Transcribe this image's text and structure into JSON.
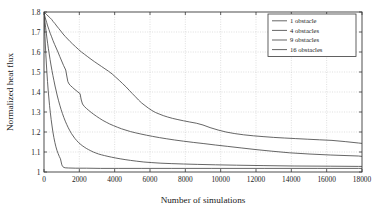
{
  "chart_data": {
    "type": "line",
    "title": "",
    "xlabel": "Number of simulations",
    "ylabel": "Normalized heat flux",
    "xlim": [
      0,
      18000
    ],
    "ylim": [
      1.0,
      1.8
    ],
    "grid": true,
    "legend_position": "top-right",
    "xticks": [
      0,
      2000,
      4000,
      6000,
      8000,
      10000,
      12000,
      14000,
      16000,
      18000
    ],
    "xtick_labels": [
      "0",
      "2000",
      "4000",
      "6000",
      "8000",
      "10000",
      "12000",
      "14000",
      "16000",
      "18000"
    ],
    "yticks": [
      1.0,
      1.1,
      1.2,
      1.3,
      1.4,
      1.5,
      1.6,
      1.7,
      1.8
    ],
    "ytick_labels": [
      "1",
      "1.1",
      "1.2",
      "1.3",
      "1.4",
      "1.5",
      "1.6",
      "1.7",
      "1.8"
    ],
    "line_color": "#4a4a4a",
    "grid_color": "#c9c9c9",
    "axis_color": "#3a3a3a",
    "series": [
      {
        "name": "1 obstacle",
        "x": [
          0,
          60,
          140,
          230,
          330,
          430,
          520,
          620,
          720,
          830,
          950,
          1080,
          1200,
          1340,
          1480,
          1620,
          1780,
          1950,
          2120,
          2300,
          2480,
          2660,
          2850,
          3050,
          3250,
          3450,
          3650,
          3860,
          4060,
          4260,
          4450,
          4650,
          4830,
          5000,
          5180,
          5350,
          5530,
          5720,
          5900,
          6100,
          6300,
          6520,
          6750,
          7000,
          7280,
          7580,
          7900,
          8250,
          8620,
          9000,
          9400,
          9850,
          10300,
          10800,
          11300,
          11850,
          12400,
          13000,
          13600,
          14250,
          14900,
          15600,
          16300,
          17050,
          17800
        ],
        "y": [
          1.8,
          1.795,
          1.788,
          1.78,
          1.772,
          1.763,
          1.752,
          1.742,
          1.73,
          1.718,
          1.705,
          1.69,
          1.678,
          1.665,
          1.652,
          1.64,
          1.627,
          1.613,
          1.6,
          1.588,
          1.576,
          1.564,
          1.552,
          1.54,
          1.528,
          1.516,
          1.504,
          1.49,
          1.474,
          1.458,
          1.442,
          1.425,
          1.408,
          1.392,
          1.376,
          1.36,
          1.345,
          1.332,
          1.32,
          1.308,
          1.298,
          1.29,
          1.282,
          1.275,
          1.268,
          1.262,
          1.256,
          1.25,
          1.244,
          1.235,
          1.222,
          1.21,
          1.2,
          1.192,
          1.186,
          1.181,
          1.177,
          1.173,
          1.17,
          1.167,
          1.164,
          1.161,
          1.158,
          1.152,
          1.145
        ],
        "final_value": 1.143
      },
      {
        "name": "4 obstacles",
        "x": [
          0,
          40,
          90,
          150,
          210,
          280,
          350,
          430,
          510,
          600,
          690,
          790,
          890,
          1000,
          1110,
          1230,
          1290,
          1350,
          1420,
          1500,
          1600,
          1700,
          1810,
          1920,
          2040,
          2110,
          2180,
          2280,
          2400,
          2530,
          2670,
          2820,
          2980,
          3150,
          3330,
          3520,
          3720,
          3930,
          4150,
          4390,
          4640,
          4900,
          5180,
          5480,
          5800,
          6150,
          6530,
          6950,
          7400,
          7900,
          8450,
          9050,
          9700,
          10400,
          11200,
          12000,
          12900,
          13900,
          15000,
          16200,
          17800
        ],
        "y": [
          1.8,
          1.782,
          1.765,
          1.748,
          1.73,
          1.712,
          1.694,
          1.676,
          1.657,
          1.638,
          1.62,
          1.6,
          1.578,
          1.555,
          1.532,
          1.51,
          1.48,
          1.452,
          1.44,
          1.432,
          1.424,
          1.416,
          1.408,
          1.4,
          1.392,
          1.36,
          1.34,
          1.328,
          1.318,
          1.308,
          1.298,
          1.288,
          1.278,
          1.268,
          1.258,
          1.249,
          1.24,
          1.232,
          1.224,
          1.216,
          1.209,
          1.202,
          1.196,
          1.19,
          1.184,
          1.178,
          1.172,
          1.166,
          1.16,
          1.154,
          1.148,
          1.142,
          1.135,
          1.128,
          1.12,
          1.112,
          1.104,
          1.096,
          1.09,
          1.085,
          1.08
        ],
        "final_value": 1.078
      },
      {
        "name": "9 obstacles",
        "x": [
          0,
          25,
          55,
          90,
          125,
          165,
          205,
          250,
          295,
          345,
          395,
          450,
          505,
          565,
          625,
          690,
          755,
          825,
          895,
          970,
          1045,
          1125,
          1205,
          1290,
          1375,
          1465,
          1555,
          1650,
          1745,
          1845,
          1945,
          2050,
          2160,
          2275,
          2395,
          2520,
          2650,
          2790,
          2935,
          3090,
          3250,
          3430,
          3620,
          3830,
          4060,
          4310,
          4590,
          4900,
          5250,
          5650,
          6100,
          6620,
          7200,
          7900,
          8700,
          9700,
          10900,
          12400,
          14200,
          16200,
          17800
        ],
        "y": [
          1.8,
          1.775,
          1.75,
          1.724,
          1.698,
          1.67,
          1.644,
          1.616,
          1.59,
          1.562,
          1.535,
          1.508,
          1.482,
          1.456,
          1.43,
          1.405,
          1.38,
          1.356,
          1.334,
          1.312,
          1.292,
          1.272,
          1.254,
          1.237,
          1.221,
          1.206,
          1.192,
          1.18,
          1.168,
          1.158,
          1.148,
          1.14,
          1.132,
          1.125,
          1.118,
          1.112,
          1.106,
          1.1,
          1.095,
          1.09,
          1.086,
          1.082,
          1.078,
          1.074,
          1.07,
          1.066,
          1.062,
          1.058,
          1.054,
          1.05,
          1.047,
          1.044,
          1.042,
          1.04,
          1.038,
          1.036,
          1.034,
          1.032,
          1.03,
          1.029,
          1.028
        ],
        "final_value": 1.028
      },
      {
        "name": "16 obstacles",
        "x": [
          0,
          15,
          35,
          55,
          80,
          105,
          135,
          165,
          200,
          235,
          275,
          315,
          360,
          405,
          455,
          505,
          560,
          615,
          675,
          735,
          800,
          865,
          930,
          960,
          985,
          1010,
          1040,
          1075,
          1120,
          1200,
          1400,
          1800,
          2400,
          3200,
          4200,
          5500,
          7200,
          9500,
          12500,
          15500,
          17800
        ],
        "y": [
          1.8,
          1.765,
          1.72,
          1.676,
          1.63,
          1.586,
          1.54,
          1.496,
          1.452,
          1.41,
          1.37,
          1.332,
          1.296,
          1.262,
          1.23,
          1.2,
          1.172,
          1.148,
          1.126,
          1.108,
          1.092,
          1.078,
          1.066,
          1.055,
          1.045,
          1.036,
          1.03,
          1.026,
          1.023,
          1.021,
          1.02,
          1.019,
          1.019,
          1.018,
          1.018,
          1.018,
          1.018,
          1.018,
          1.018,
          1.018,
          1.018
        ],
        "final_value": 1.018
      }
    ]
  },
  "legend": {
    "items": [
      {
        "label": "1 obstacle"
      },
      {
        "label": "4 obstacles"
      },
      {
        "label": "9 obstacles"
      },
      {
        "label": "16 obstacles"
      }
    ]
  }
}
